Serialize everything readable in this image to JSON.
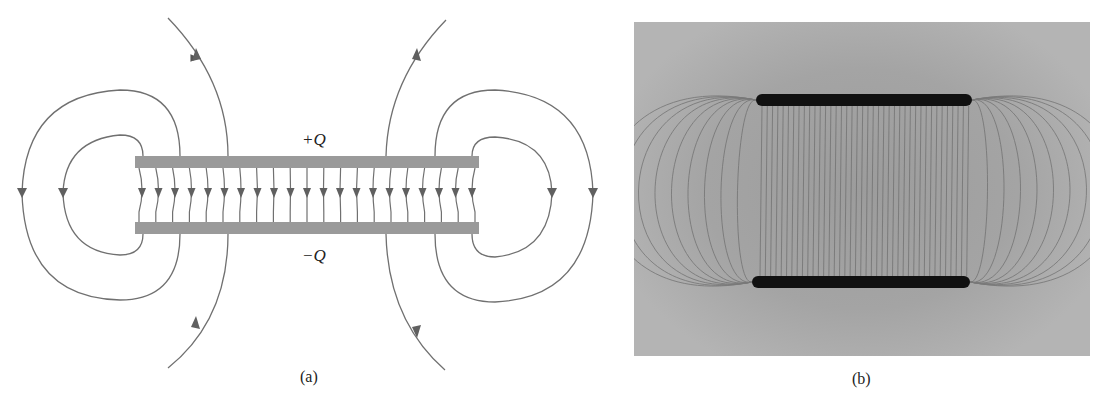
{
  "figure_a": {
    "caption": "(a)",
    "top_plate_label": "+Q",
    "bottom_plate_label": "−Q",
    "plate_color": "#9a9a9a",
    "line_color": "#666666",
    "interior_field_lines": 20
  },
  "figure_b": {
    "caption": "(b)",
    "description": "Photograph of field lines between two charged parallel plates"
  }
}
